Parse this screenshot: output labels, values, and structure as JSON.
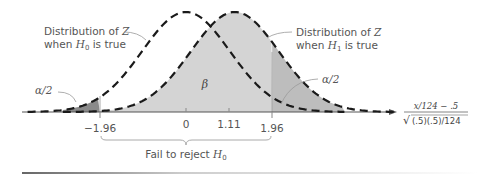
{
  "diagram": {
    "type": "hypothesis-test-normal-distributions",
    "labels": {
      "h0_dist": {
        "line1_prefix": "Distribution of ",
        "line1_var": "Z",
        "line2_prefix": "when ",
        "line2_var": "H",
        "line2_sub": "0",
        "line2_suffix": " is true"
      },
      "h1_dist": {
        "line1_prefix": "Distribution of ",
        "line1_var": "Z",
        "line2_prefix": "when ",
        "line2_var": "H",
        "line2_sub": "1",
        "line2_suffix": " is true"
      },
      "alpha_left": "α/2",
      "alpha_right": "α/2",
      "beta": "β",
      "fail_to_reject": {
        "prefix": "Fail to reject ",
        "var": "H",
        "sub": "0"
      },
      "axis_numerator": "x/124 − .5",
      "axis_denominator": "(.5)(.5)/124",
      "axis_radical": "√"
    },
    "ticks": [
      {
        "value": -1.96,
        "label": "−1.96"
      },
      {
        "value": 0,
        "label": "0"
      },
      {
        "value": 1.11,
        "label": "1.11"
      },
      {
        "value": 1.96,
        "label": "1.96"
      }
    ],
    "colors": {
      "curve": "#1a1a1a",
      "beta_fill": "#d4d4d4",
      "alpha_fill": "#8a8a8a",
      "axis": "#555555",
      "text": "#555555"
    },
    "h0_mean": 0,
    "h1_mean": 1.11,
    "critical_values": [
      -1.96,
      1.96
    ]
  }
}
